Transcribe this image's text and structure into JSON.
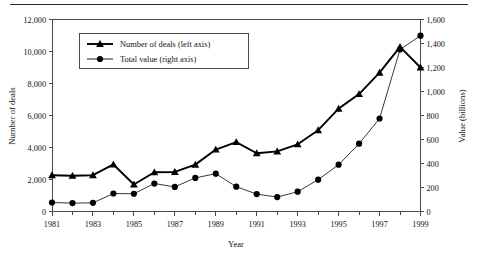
{
  "figure": {
    "top_rule": true,
    "background": "#ffffff",
    "line_color": "#000000"
  },
  "chart_data": {
    "type": "line",
    "title": "",
    "subtitle": "",
    "xlabel": "Year",
    "ylabel": "Number of deals",
    "y2label": "Value (billions)",
    "grid": false,
    "legend_position": "upper-left-inside",
    "x": [
      1981,
      1982,
      1983,
      1984,
      1985,
      1986,
      1987,
      1988,
      1989,
      1990,
      1991,
      1992,
      1993,
      1994,
      1995,
      1996,
      1997,
      1998,
      1999
    ],
    "xlim": [
      1981,
      1999
    ],
    "xtick_labels": [
      "1981",
      "1983",
      "1985",
      "1987",
      "1989",
      "1991",
      "1993",
      "1995",
      "1997",
      "1999"
    ],
    "xtick_values": [
      1981,
      1983,
      1985,
      1987,
      1989,
      1991,
      1993,
      1995,
      1997,
      1999
    ],
    "xminor_every": 1,
    "ylim": [
      0,
      12000
    ],
    "ytick_labels": [
      "0",
      "2,000",
      "4,000",
      "6,000",
      "8,000",
      "10,000",
      "12,000"
    ],
    "ytick_values": [
      0,
      2000,
      4000,
      6000,
      8000,
      10000,
      12000
    ],
    "y2lim": [
      0,
      1600
    ],
    "y2tick_labels": [
      "0",
      "200",
      "400",
      "600",
      "800",
      "1,000",
      "1,200",
      "1,400",
      "1,600"
    ],
    "y2tick_values": [
      0,
      200,
      400,
      600,
      800,
      1000,
      1200,
      1400,
      1600
    ],
    "series": [
      {
        "name": "Number of deals (left axis)",
        "axis": "left",
        "marker": "triangle",
        "color": "#000000",
        "values": [
          2270,
          2230,
          2270,
          2940,
          1690,
          2450,
          2470,
          2930,
          3870,
          4340,
          3640,
          3760,
          4200,
          5080,
          6430,
          7340,
          8680,
          10290,
          9000
        ]
      },
      {
        "name": "Total value (right axis)",
        "axis": "right",
        "marker": "circle",
        "color": "#000000",
        "values": [
          75,
          70,
          72,
          150,
          148,
          233,
          205,
          280,
          315,
          207,
          145,
          120,
          165,
          265,
          390,
          565,
          775,
          1350,
          1465
        ]
      }
    ],
    "annotations": []
  },
  "legend": {
    "items": [
      {
        "label": "Number of deals (left axis)",
        "marker": "triangle"
      },
      {
        "label": "Total value (right axis)",
        "marker": "circle"
      }
    ]
  }
}
